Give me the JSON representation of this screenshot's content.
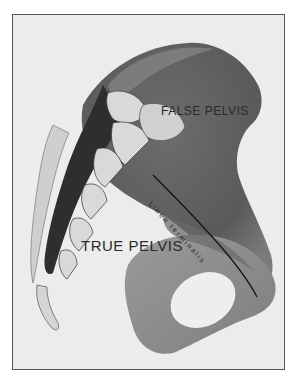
{
  "figure": {
    "labels": {
      "false_pelvis": "FALSE PELVIS",
      "true_pelvis": "TRUE PELVIS",
      "linea_terminalis": "Linea terminalis"
    },
    "colors": {
      "background": "#ffffff",
      "plate": "#ececec",
      "bone_dark": "#5e5e5e",
      "bone_mid": "#8a8a8a",
      "bone_light": "#c4c4c4",
      "cartilage": "#d9d9d9",
      "shadow": "#2e2e2e",
      "border": "#555555"
    }
  }
}
